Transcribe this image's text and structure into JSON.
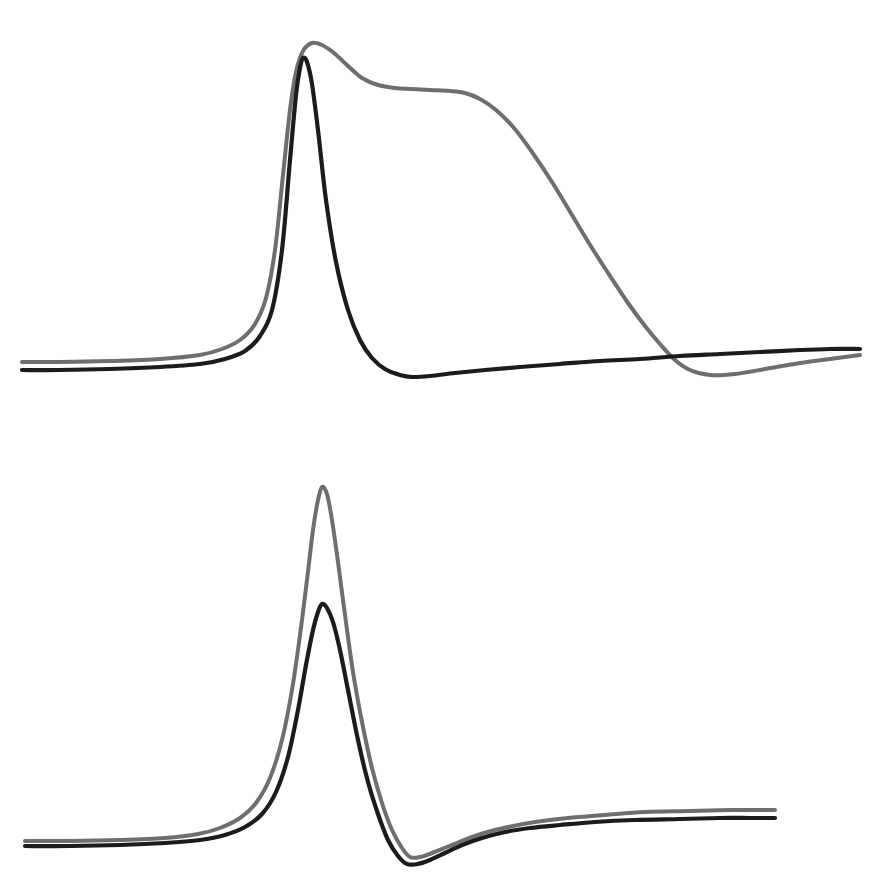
{
  "figure": {
    "background_color": "#ffffff",
    "width": 895,
    "height": 896,
    "panel_count": 2,
    "has_axes": false,
    "has_text_labels": false,
    "has_legend": false,
    "has_gridlines": false
  },
  "series_style": {
    "black_color": "#1b1b1b",
    "gray_color": "#6e6e6e",
    "black_width": 4.2,
    "gray_width": 4.0
  },
  "chart_data": [
    {
      "type": "line",
      "title": "",
      "subtitle": "",
      "xlabel": "",
      "ylabel": "",
      "panel": "top",
      "panel_index": 0,
      "grid": false,
      "legend": false,
      "axis_visible": false,
      "xlim": [
        0,
        895
      ],
      "ylim": [
        448,
        0
      ],
      "tick_labels_x": [],
      "tick_labels_y": [],
      "annotations": [],
      "series": [
        {
          "name": "black-trace-top",
          "color": "#1b1b1b",
          "description": "Narrow sharp peak with deep undershoot that slowly recovers toward a slightly rising baseline",
          "peak_x": 303,
          "peak_y": 58,
          "baseline_left_y": 370,
          "baseline_right_y": 349,
          "undershoot_x": 412,
          "undershoot_y": 377,
          "x": [
            22,
            60,
            110,
            160,
            200,
            225,
            245,
            260,
            272,
            282,
            290,
            296,
            300,
            303,
            307,
            312,
            318,
            326,
            336,
            348,
            360,
            372,
            385,
            400,
            412,
            430,
            455,
            485,
            520,
            560,
            600,
            640,
            680,
            720,
            760,
            800,
            830,
            860
          ],
          "y": [
            370,
            370,
            369,
            367,
            364,
            359,
            351,
            336,
            310,
            250,
            160,
            95,
            68,
            58,
            62,
            84,
            130,
            200,
            262,
            310,
            340,
            358,
            369,
            375,
            377,
            376,
            373,
            370,
            367,
            364,
            361,
            359,
            356,
            354,
            352,
            350,
            349,
            349
          ]
        },
        {
          "name": "gray-trace-top",
          "color": "#6e6e6e",
          "description": "Broad peak followed by a long plateau shoulder then a slow sigmoid decay into a shallow late undershoot",
          "peak_x": 312,
          "peak_y": 43,
          "baseline_left_y": 362,
          "baseline_right_y": 355,
          "shoulder_x": 430,
          "shoulder_y": 90,
          "undershoot_x": 683,
          "undershoot_y": 375,
          "x": [
            22,
            60,
            110,
            160,
            200,
            222,
            240,
            255,
            266,
            275,
            283,
            290,
            296,
            303,
            312,
            322,
            334,
            348,
            362,
            378,
            395,
            412,
            430,
            450,
            465,
            480,
            496,
            514,
            532,
            552,
            572,
            592,
            610,
            628,
            645,
            660,
            675,
            690,
            710,
            735,
            765,
            800,
            830,
            860
          ],
          "y": [
            362,
            362,
            361,
            359,
            355,
            349,
            340,
            324,
            298,
            250,
            175,
            110,
            72,
            51,
            43,
            45,
            53,
            66,
            78,
            85,
            88,
            89,
            90,
            91,
            93,
            99,
            110,
            128,
            152,
            182,
            215,
            248,
            276,
            303,
            326,
            344,
            360,
            370,
            375,
            374,
            369,
            363,
            359,
            355
          ]
        }
      ]
    },
    {
      "type": "line",
      "title": "",
      "subtitle": "",
      "xlabel": "",
      "ylabel": "",
      "panel": "bottom",
      "panel_index": 1,
      "grid": false,
      "legend": false,
      "axis_visible": false,
      "xlim": [
        0,
        895
      ],
      "ylim": [
        448,
        0
      ],
      "tick_labels_x": [],
      "tick_labels_y": [],
      "annotations": [],
      "series": [
        {
          "name": "black-trace-bottom",
          "color": "#1b1b1b",
          "description": "Narrow peak of moderate amplitude with an undershoot trough that recovers to a flat elevated baseline",
          "peak_x": 322,
          "peak_y": 604,
          "baseline_left_y": 846,
          "baseline_right_y": 818,
          "undershoot_x": 407,
          "undershoot_y": 864,
          "x": [
            25,
            70,
            120,
            165,
            200,
            225,
            245,
            262,
            276,
            288,
            298,
            306,
            313,
            318,
            322,
            327,
            333,
            340,
            348,
            358,
            368,
            378,
            388,
            398,
            407,
            418,
            430,
            445,
            462,
            482,
            505,
            530,
            560,
            595,
            635,
            680,
            720,
            750,
            775
          ],
          "y": [
            846,
            846,
            845,
            843,
            840,
            835,
            827,
            814,
            792,
            757,
            710,
            665,
            630,
            612,
            604,
            608,
            622,
            650,
            690,
            740,
            782,
            814,
            840,
            856,
            864,
            864,
            860,
            853,
            845,
            838,
            832,
            828,
            825,
            822,
            820,
            819,
            818,
            818,
            818
          ]
        },
        {
          "name": "gray-trace-bottom",
          "color": "#6e6e6e",
          "description": "Tall narrow peak roughly twice the black amplitude, with a shallower undershoot and a flat baseline slightly above black",
          "peak_x": 322,
          "peak_y": 487,
          "baseline_left_y": 841,
          "baseline_right_y": 810,
          "undershoot_x": 410,
          "undershoot_y": 857,
          "x": [
            25,
            70,
            120,
            165,
            198,
            220,
            240,
            256,
            270,
            282,
            292,
            300,
            307,
            313,
            318,
            322,
            327,
            332,
            338,
            345,
            353,
            362,
            372,
            382,
            392,
            402,
            410,
            420,
            432,
            447,
            464,
            484,
            508,
            535,
            568,
            605,
            645,
            690,
            730,
            760,
            775
          ],
          "y": [
            841,
            841,
            840,
            838,
            834,
            828,
            818,
            803,
            778,
            740,
            690,
            635,
            580,
            530,
            500,
            487,
            494,
            520,
            562,
            615,
            672,
            722,
            768,
            803,
            830,
            848,
            857,
            857,
            853,
            847,
            840,
            833,
            827,
            822,
            818,
            815,
            812,
            811,
            810,
            810,
            810
          ]
        }
      ]
    }
  ]
}
